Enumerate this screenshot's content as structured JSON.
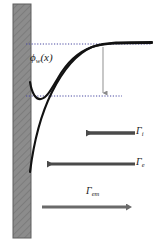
{
  "figure": {
    "type": "physics-schematic",
    "background_color": "#ffffff",
    "wall": {
      "name": "wall",
      "fill_color": "#8a8a8a",
      "hatch_color": "#6e6e6e",
      "x": 13,
      "y": 4,
      "width": 18,
      "height": 234
    },
    "curves": {
      "color": "#111111",
      "primary": {
        "name": "potential-profile-with-dip",
        "label": "phi_w(x)",
        "shape": "rises from wall, local minimum then monotonic rise to plateau"
      },
      "secondary": {
        "name": "potential-profile-monotonic",
        "shape": "steep monotonic rise from deep below wall contact to plateau"
      },
      "plateau_y": 44,
      "minimum_y": 96
    },
    "reference_lines": {
      "color": "#3a3a8a",
      "upper": {
        "name": "plateau-reference-line",
        "y": 44,
        "x1": 26,
        "x2": 152
      },
      "lower": {
        "name": "minimum-reference-line",
        "y": 96,
        "x1": 26,
        "x2": 122
      },
      "drop_indicator": {
        "name": "potential-drop-arrow",
        "x": 103,
        "y1": 48,
        "y2": 96,
        "color": "#8a8a8a"
      }
    },
    "labels": {
      "potential": {
        "base": "ϕ",
        "sub": "w",
        "arg": "(x)"
      },
      "flux_ion": {
        "base": "Γ",
        "sub": "i"
      },
      "flux_electron": {
        "base": "Γ",
        "sub": "e"
      },
      "flux_emission": {
        "base": "Γ",
        "sub": "em"
      }
    },
    "arrows": [
      {
        "name": "ion-flux-arrow",
        "label_key": "flux_ion",
        "direction": "left",
        "color": "#4a4a4a",
        "tail_x": 135,
        "head_x": 83,
        "y": 133,
        "thickness": 3.5
      },
      {
        "name": "electron-flux-arrow",
        "label_key": "flux_electron",
        "direction": "left",
        "color": "#4a4a4a",
        "tail_x": 135,
        "head_x": 44,
        "y": 164,
        "thickness": 3.0
      },
      {
        "name": "emission-flux-arrow",
        "label_key": "flux_emission",
        "direction": "right",
        "color": "#6a6a6a",
        "tail_x": 42,
        "head_x": 129,
        "y": 207,
        "thickness": 3.0
      }
    ]
  }
}
